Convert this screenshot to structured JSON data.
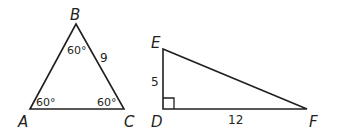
{
  "figure": {
    "triangle1": {
      "vertices": {
        "A": "A",
        "B": "B",
        "C": "C"
      },
      "angles": {
        "A": "60°",
        "B": "60°",
        "C": "60°"
      },
      "sides": {
        "BC": "9"
      }
    },
    "triangle2": {
      "vertices": {
        "D": "D",
        "E": "E",
        "F": "F"
      },
      "sides": {
        "DE": "5",
        "DF": "12"
      },
      "right_angle_at": "D"
    },
    "stroke_color": "#231f20"
  }
}
